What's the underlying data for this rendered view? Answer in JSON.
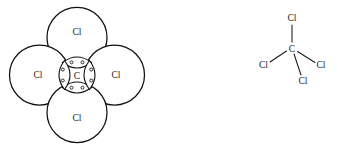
{
  "figure": {
    "background_color": "#ffffff",
    "line_color": "#111111",
    "text_color": "#1a1a1a"
  },
  "space_filling_model": {
    "name": "ccl4-space-filling-model",
    "center_atom": {
      "symbol": "C",
      "cx": 77,
      "cy": 75,
      "r": 15.5
    },
    "outer_atoms": [
      {
        "symbol": "Cl",
        "position": "top",
        "cx": 77,
        "cy": 37.5,
        "r": 30
      },
      {
        "symbol": "Cl",
        "position": "left",
        "cx": 39.5,
        "cy": 75,
        "r": 30
      },
      {
        "symbol": "Cl",
        "position": "right",
        "cx": 114.5,
        "cy": 75,
        "r": 30
      },
      {
        "symbol": "Cl",
        "position": "bottom",
        "cx": 77,
        "cy": 112.5,
        "r": 30
      }
    ],
    "bonding_pairs": [
      {
        "position": "top",
        "electrons": 2,
        "orientation": "horizontal"
      },
      {
        "position": "left",
        "electrons": 2,
        "orientation": "vertical"
      },
      {
        "position": "right",
        "electrons": 2,
        "orientation": "vertical"
      },
      {
        "position": "bottom",
        "electrons": 2,
        "orientation": "horizontal"
      }
    ],
    "electron_dot_radius": 1.5,
    "total_shared_electrons": 8,
    "bond_count": 4
  },
  "structural_formula": {
    "name": "ccl4-structural-formula",
    "center_atom": {
      "symbol": "C",
      "x": 292,
      "y": 49
    },
    "substituents": [
      {
        "symbol": "Cl",
        "position": "top",
        "x": 292,
        "y": 18
      },
      {
        "symbol": "Cl",
        "position": "left",
        "x": 263.5,
        "y": 65
      },
      {
        "symbol": "Cl",
        "position": "right",
        "x": 321,
        "y": 65
      },
      {
        "symbol": "Cl",
        "position": "bottom-right",
        "x": 303,
        "y": 81
      }
    ],
    "bonds": [
      {
        "from": "C",
        "to": "Cl-top",
        "x1": 292,
        "y1": 42,
        "x2": 292,
        "y2": 25
      },
      {
        "from": "C",
        "to": "Cl-left",
        "x1": 286.5,
        "y1": 51,
        "x2": 270,
        "y2": 62
      },
      {
        "from": "C",
        "to": "Cl-right",
        "x1": 297.5,
        "y1": 51.5,
        "x2": 315,
        "y2": 62.5
      },
      {
        "from": "C",
        "to": "Cl-bottom-right",
        "x1": 294,
        "y1": 54,
        "x2": 301,
        "y2": 75
      }
    ],
    "bond_count": 4
  }
}
